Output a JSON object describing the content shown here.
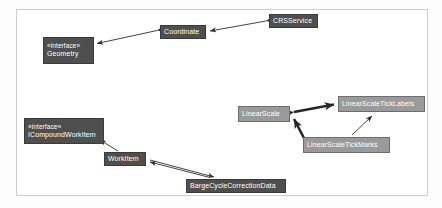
{
  "diagram": {
    "kind": "uml-class-dependency-diagram",
    "frame": {
      "name": "diagram-frame"
    },
    "colors": {
      "dark_node": "#4f4f4f",
      "mid_node": "#9a9a9a",
      "node_text": "#ffffff",
      "edge": "#2f2f2f",
      "frame_border": "#cfcfcf",
      "background": "#ffffff"
    },
    "nodes": [
      {
        "id": "geometry",
        "stereotype": "«interface»",
        "name": "Geometry",
        "style": "dark",
        "x": 43,
        "y": 37,
        "w": 51,
        "h": 27
      },
      {
        "id": "coordinate",
        "stereotype": "",
        "name": "Coordinate",
        "style": "dark",
        "x": 160,
        "y": 25,
        "w": 46,
        "h": 14
      },
      {
        "id": "crsservice",
        "stereotype": "",
        "name": "CRSService",
        "style": "dark",
        "x": 269,
        "y": 14,
        "w": 49,
        "h": 14
      },
      {
        "id": "icompoundworkitem",
        "stereotype": "«interface»",
        "name": "ICompoundWorkItem",
        "style": "dark",
        "x": 24,
        "y": 118,
        "w": 80,
        "h": 26
      },
      {
        "id": "workitem",
        "stereotype": "",
        "name": "WorkItem",
        "style": "dark",
        "x": 104,
        "y": 152,
        "w": 42,
        "h": 14
      },
      {
        "id": "bargecyclecorrectiondata",
        "stereotype": "",
        "name": "BargeCycleCorrectionData",
        "style": "dark",
        "x": 186,
        "y": 179,
        "w": 100,
        "h": 14
      },
      {
        "id": "linearscale",
        "stereotype": "",
        "name": "LinearScale",
        "style": "mid",
        "x": 238,
        "y": 106,
        "w": 52,
        "h": 16
      },
      {
        "id": "linearscaleticklabels",
        "stereotype": "",
        "name": "LinearScaleTickLabels",
        "style": "mid",
        "x": 338,
        "y": 96,
        "w": 87,
        "h": 16
      },
      {
        "id": "linearscaletickmarks",
        "stereotype": "",
        "name": "LinearScaleTickMarks",
        "style": "mid",
        "x": 303,
        "y": 137,
        "w": 87,
        "h": 16
      }
    ],
    "edges": [
      {
        "id": "e1",
        "from": "coordinate",
        "to": "geometry",
        "arrows": "both",
        "weight": "thin"
      },
      {
        "id": "e2",
        "from": "crsservice",
        "to": "coordinate",
        "arrows": "both",
        "weight": "thin"
      },
      {
        "id": "e3",
        "from": "workitem",
        "to": "icompoundworkitem",
        "arrows": "to",
        "weight": "thin"
      },
      {
        "id": "e4",
        "from": "bargecyclecorrectiondata",
        "to": "workitem",
        "arrows": "to",
        "weight": "thin"
      },
      {
        "id": "e5",
        "from": "linearscale",
        "to": "linearscaleticklabels",
        "arrows": "both",
        "weight": "thick"
      },
      {
        "id": "e6",
        "from": "linearscaletickmarks",
        "to": "linearscale",
        "arrows": "both",
        "weight": "thick"
      },
      {
        "id": "e7",
        "from": "linearscaletickmarks",
        "to": "linearscaleticklabels",
        "arrows": "to",
        "weight": "thin"
      }
    ]
  }
}
